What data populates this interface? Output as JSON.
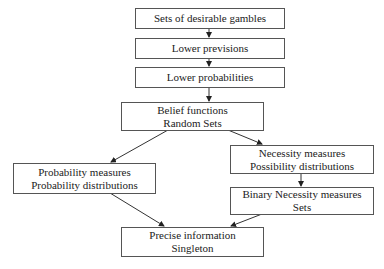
{
  "diagram": {
    "nodes": [
      {
        "id": "desirable-gambles",
        "lines": [
          "Sets of desirable gambles"
        ]
      },
      {
        "id": "lower-previsions",
        "lines": [
          "Lower previsions"
        ]
      },
      {
        "id": "lower-probabilities",
        "lines": [
          "Lower probabilities"
        ]
      },
      {
        "id": "belief-functions",
        "lines": [
          "Belief functions",
          "Random Sets"
        ]
      },
      {
        "id": "necessity-measures",
        "lines": [
          "Necessity measures",
          "Possibility distributions"
        ]
      },
      {
        "id": "probability-measures",
        "lines": [
          "Probability measures",
          "Probability distributions"
        ]
      },
      {
        "id": "binary-necessity",
        "lines": [
          "Binary Necessity measures",
          "Sets"
        ]
      },
      {
        "id": "precise-information",
        "lines": [
          "Precise information",
          "Singleton"
        ]
      }
    ],
    "edges": [
      [
        "desirable-gambles",
        "lower-previsions"
      ],
      [
        "lower-previsions",
        "lower-probabilities"
      ],
      [
        "lower-probabilities",
        "belief-functions"
      ],
      [
        "belief-functions",
        "probability-measures"
      ],
      [
        "belief-functions",
        "necessity-measures"
      ],
      [
        "necessity-measures",
        "binary-necessity"
      ],
      [
        "probability-measures",
        "precise-information"
      ],
      [
        "binary-necessity",
        "precise-information"
      ]
    ]
  }
}
